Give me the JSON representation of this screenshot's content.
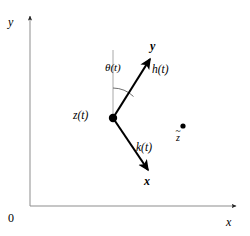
{
  "figure": {
    "type": "vector-diagram",
    "background_color": "#ffffff",
    "ink_color": "#000000",
    "guide_color": "#9a9a9a",
    "axes": {
      "x_label": "x",
      "y_label": "y",
      "origin_label": "0",
      "x_axis": {
        "x1": 30,
        "y1": 206,
        "x2": 238,
        "y2": 206,
        "arrow": "right"
      },
      "y_axis": {
        "x1": 30,
        "y1": 206,
        "x2": 30,
        "y2": 14,
        "arrow": "up"
      }
    },
    "body_point": {
      "label": "z(t)",
      "x": 113,
      "y": 118,
      "radius": 4.2
    },
    "material_point": {
      "label": "z",
      "accent": "~",
      "x": 183,
      "y": 126,
      "radius": 2.6
    },
    "reference_line": {
      "name": "vertical-reference",
      "x1": 113,
      "y1": 118,
      "x2": 113,
      "y2": 50,
      "color": "#9a9a9a"
    },
    "angle_arc": {
      "label": "θ(t)",
      "center_x": 113,
      "center_y": 118,
      "radius": 30,
      "start_deg": 90,
      "end_deg": 47
    },
    "vectors": [
      {
        "name": "h",
        "label": "h(t)",
        "head_label": "y",
        "x1": 113,
        "y1": 118,
        "x2": 152,
        "y2": 56
      },
      {
        "name": "k",
        "label": "k(t)",
        "head_label": "x",
        "x1": 113,
        "y1": 118,
        "x2": 150,
        "y2": 173
      }
    ]
  }
}
